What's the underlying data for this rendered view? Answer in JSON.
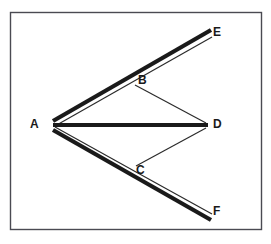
{
  "figure": {
    "title": "",
    "canvas": {
      "width": 271,
      "height": 244,
      "background": "#ffffff"
    },
    "frame": {
      "name": "figure-border",
      "x": 10.5,
      "y": 12.5,
      "width": 251,
      "height": 217,
      "stroke": "#4a4a52",
      "stroke_width": 1.4
    },
    "colors": {
      "thick_stroke": "#1a1a1a",
      "thin_stroke": "#2b2b2b",
      "label_text": "#1a1a1a",
      "background": "#ffffff",
      "border": "#4a4a52"
    },
    "points": [
      {
        "id": "A",
        "label": "A",
        "x": 53,
        "y": 125,
        "label_x": 30,
        "label_y": 118
      },
      {
        "id": "B",
        "label": "B",
        "x": 133,
        "y": 84,
        "label_x": 138,
        "label_y": 74
      },
      {
        "id": "C",
        "label": "C",
        "x": 133,
        "y": 166,
        "label_x": 136,
        "label_y": 164
      },
      {
        "id": "D",
        "label": "D",
        "x": 207,
        "y": 125,
        "label_x": 213,
        "label_y": 118
      },
      {
        "id": "E",
        "label": "E",
        "x": 210,
        "y": 32,
        "label_x": 213,
        "label_y": 26
      },
      {
        "id": "F",
        "label": "F",
        "x": 210,
        "y": 217,
        "label_x": 213,
        "label_y": 205
      }
    ],
    "thick_segments": [
      {
        "name": "segment-A-E",
        "from": "A",
        "to": "E",
        "x1": 53,
        "y1": 121,
        "x2": 211,
        "y2": 30,
        "width": 4.2
      },
      {
        "name": "segment-A-D",
        "from": "A",
        "to": "D",
        "x1": 53,
        "y1": 125,
        "x2": 208,
        "y2": 125,
        "width": 4.2
      },
      {
        "name": "segment-A-F",
        "from": "A",
        "to": "F",
        "x1": 53,
        "y1": 130,
        "x2": 211,
        "y2": 220,
        "width": 4.2
      }
    ],
    "thin_segments": [
      {
        "name": "segment-A-B",
        "from": "A",
        "to": "B",
        "x1": 55,
        "y1": 126,
        "x2": 136,
        "y2": 80,
        "width": 1.2
      },
      {
        "name": "segment-B-E",
        "from": "B",
        "to": "E",
        "x1": 136,
        "y1": 80,
        "x2": 212,
        "y2": 37,
        "width": 1.2
      },
      {
        "name": "segment-B-D",
        "from": "B",
        "to": "D",
        "x1": 135,
        "y1": 85,
        "x2": 206,
        "y2": 123,
        "width": 1.2
      },
      {
        "name": "segment-A-C",
        "from": "A",
        "to": "C",
        "x1": 55,
        "y1": 127,
        "x2": 136,
        "y2": 172,
        "width": 1.2
      },
      {
        "name": "segment-C-F",
        "from": "C",
        "to": "F",
        "x1": 136,
        "y1": 172,
        "x2": 212,
        "y2": 214,
        "width": 1.2
      },
      {
        "name": "segment-C-D",
        "from": "C",
        "to": "D",
        "x1": 136,
        "y1": 166,
        "x2": 206,
        "y2": 128,
        "width": 1.2
      }
    ]
  }
}
